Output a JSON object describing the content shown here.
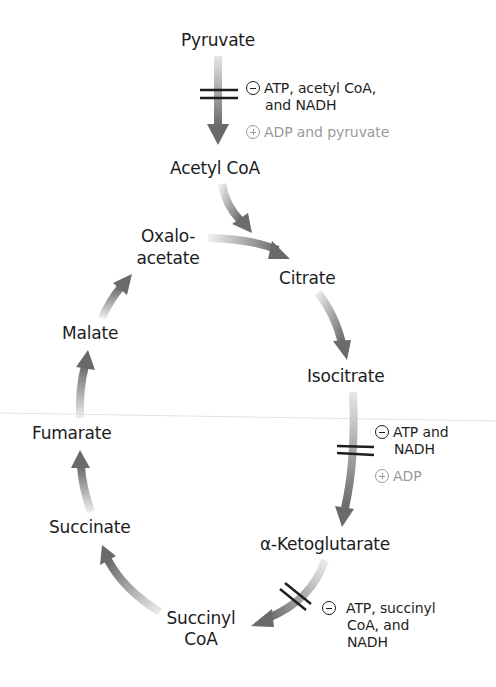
{
  "figure": {
    "colors": {
      "background": "#ffffff",
      "text": "#1c1c1c",
      "arrow": "#6e6e6e",
      "activator_text": "#9a9a9a",
      "block_bars": "#1e1e1e"
    }
  },
  "metabolites": {
    "pyruvate": "Pyruvate",
    "acetyl_coa": "Acetyl CoA",
    "oxaloacetate_line1": "Oxalo-",
    "oxaloacetate_line2": "acetate",
    "citrate": "Citrate",
    "isocitrate": "Isocitrate",
    "alpha_ketoglutarate": "α-Ketoglutarate",
    "succinyl_coa_line1": "Succinyl",
    "succinyl_coa_line2": "CoA",
    "succinate": "Succinate",
    "fumarate": "Fumarate",
    "malate": "Malate"
  },
  "regulation": {
    "pyruvate_dehydrogenase": {
      "inhibitors_line1": "ATP, acetyl CoA,",
      "inhibitors_line2": "and NADH",
      "activators": "ADP and pyruvate"
    },
    "isocitrate_dehydrogenase": {
      "inhibitors_line1": "ATP and",
      "inhibitors_line2": "NADH",
      "activators": "ADP"
    },
    "alpha_ketoglutarate_dehydrogenase": {
      "inhibitors_line1": "ATP, succinyl",
      "inhibitors_line2": "CoA, and",
      "inhibitors_line3": "NADH"
    }
  },
  "legend_symbols": {
    "inhibit": "minus-circle",
    "activate": "plus-circle",
    "control_point": "double-bar"
  }
}
